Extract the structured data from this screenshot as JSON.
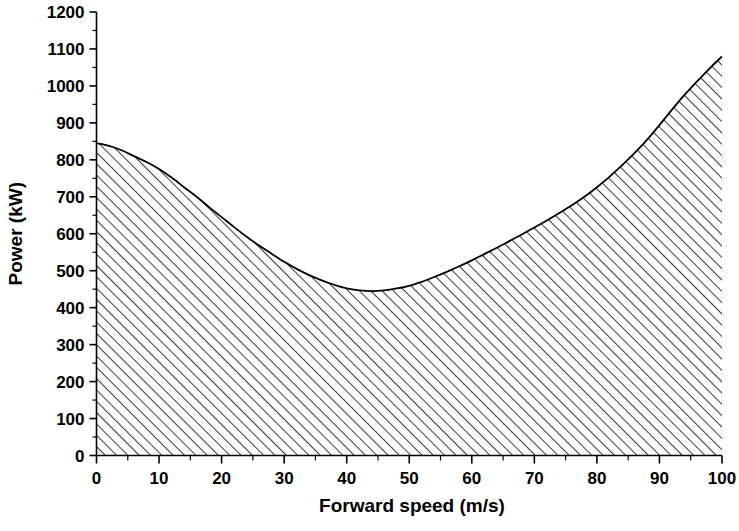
{
  "chart_data": {
    "type": "area",
    "title": "",
    "subtitle": "",
    "xlabel": "Forward speed (m/s)",
    "ylabel": "Power (kW)",
    "xlim": [
      0,
      100
    ],
    "ylim": [
      0,
      1200
    ],
    "xticks": [
      0,
      10,
      20,
      30,
      40,
      50,
      60,
      70,
      80,
      90,
      100
    ],
    "xtick_labels": [
      "0",
      "10",
      "20",
      "30",
      "40",
      "50",
      "60",
      "70",
      "80",
      "90",
      "100"
    ],
    "x_minor_tick_step": 5,
    "yticks": [
      0,
      100,
      200,
      300,
      400,
      500,
      600,
      700,
      800,
      900,
      1000,
      1100,
      1200
    ],
    "ytick_labels": [
      "0",
      "100",
      "200",
      "300",
      "400",
      "500",
      "600",
      "700",
      "800",
      "900",
      "1000",
      "1100",
      "1200"
    ],
    "y_minor_tick_step": 50,
    "grid": false,
    "legend": null,
    "annotations": [],
    "fill_style": "diagonal-hatch",
    "fill_description": "Region between curve and x-axis filled with 45-degree diagonal hatch lines",
    "series": [
      {
        "name": "Power required",
        "x": [
          0,
          2,
          4,
          6,
          8,
          10,
          12,
          14,
          16,
          18,
          20,
          22,
          24,
          26,
          28,
          30,
          32,
          34,
          36,
          38,
          40,
          42,
          44,
          46,
          48,
          50,
          52,
          54,
          56,
          58,
          60,
          62,
          64,
          66,
          68,
          70,
          72,
          74,
          76,
          78,
          80,
          82,
          84,
          86,
          88,
          90,
          92,
          94,
          96,
          98,
          100
        ],
        "y": [
          845,
          838,
          826,
          810,
          794,
          775,
          752,
          726,
          700,
          672,
          645,
          618,
          592,
          568,
          546,
          524,
          505,
          488,
          474,
          462,
          452,
          447,
          445,
          447,
          452,
          459,
          470,
          483,
          497,
          512,
          528,
          545,
          562,
          580,
          598,
          617,
          636,
          656,
          677,
          700,
          726,
          754,
          785,
          818,
          854,
          894,
          936,
          976,
          1012,
          1047,
          1080
        ]
      }
    ]
  },
  "axes": {
    "y_axis_title": "Power (kW)",
    "x_axis_title": "Forward speed (m/s)"
  }
}
